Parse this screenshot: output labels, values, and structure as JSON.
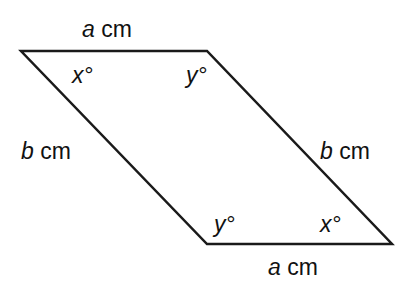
{
  "diagram": {
    "shape": "parallelogram",
    "vertices": {
      "top_left": [
        21,
        51
      ],
      "top_right": [
        207,
        51
      ],
      "bottom_right": [
        392,
        244
      ],
      "bottom_left": [
        207,
        244
      ]
    },
    "side_labels": {
      "top": {
        "var": "a",
        "unit": "cm"
      },
      "bottom": {
        "var": "a",
        "unit": "cm"
      },
      "left": {
        "var": "b",
        "unit": "cm"
      },
      "right": {
        "var": "b",
        "unit": "cm"
      }
    },
    "angle_labels": {
      "top_left": "x°",
      "top_right": "y°",
      "bottom_left": "y°",
      "bottom_right": "x°"
    },
    "stroke_color": "#1a1a1a"
  }
}
